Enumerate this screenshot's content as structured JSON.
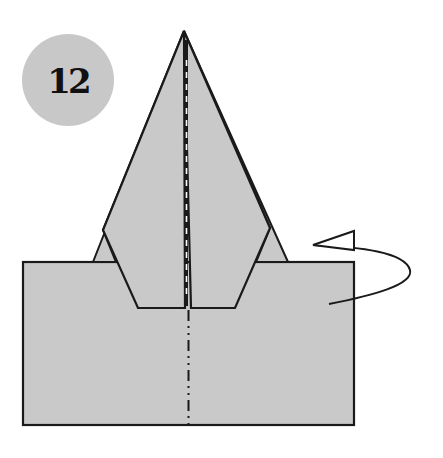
{
  "step": {
    "number": "12",
    "badge_color": "#c8c8c8",
    "text_color": "#111111"
  },
  "colors": {
    "paper_fill": "#c9c9c9",
    "line": "#1a1a1a",
    "background": "#ffffff"
  },
  "diagram": {
    "icons": [
      "mountain-fold-line",
      "turn-over-arrow"
    ]
  }
}
